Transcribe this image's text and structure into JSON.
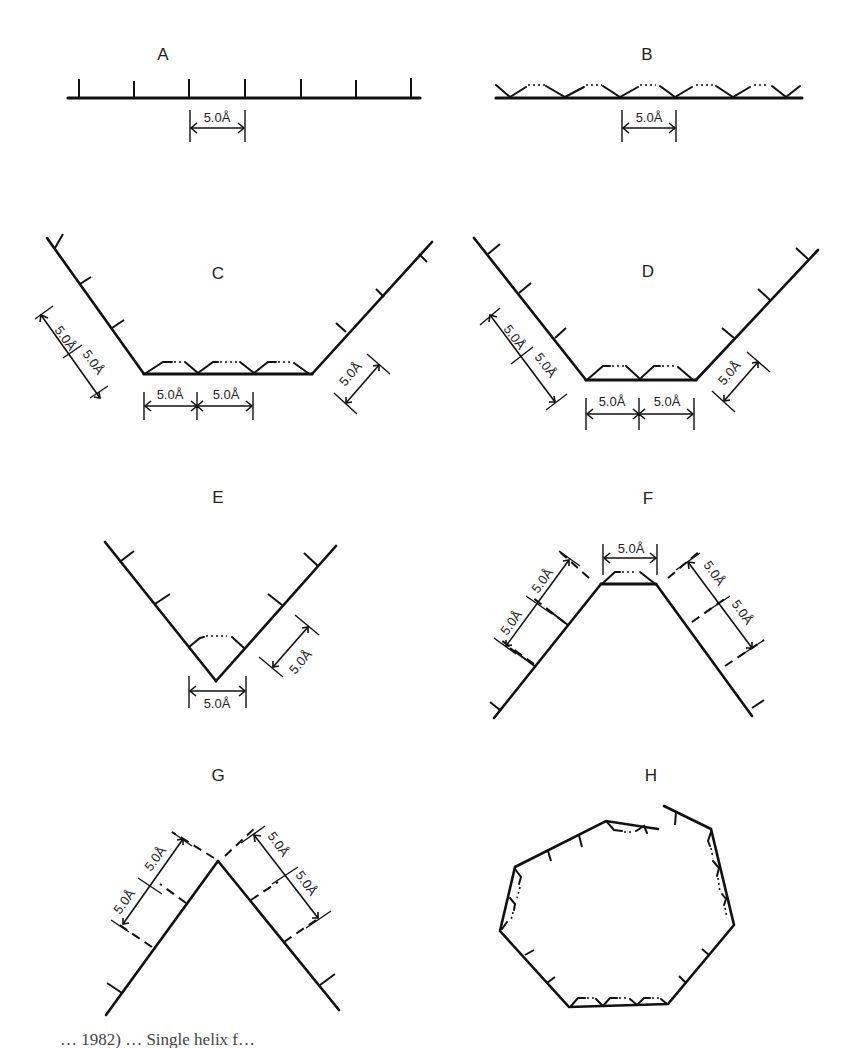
{
  "figure": {
    "panels": [
      {
        "id": "A",
        "label": "A",
        "dimensions": [
          "5.0Å"
        ]
      },
      {
        "id": "B",
        "label": "B",
        "dimensions": [
          "5.0Å"
        ]
      },
      {
        "id": "C",
        "label": "C",
        "dimensions": [
          "5.0Å",
          "5.0Å",
          "5.0Å",
          "5.0Å",
          "5.0Å"
        ]
      },
      {
        "id": "D",
        "label": "D",
        "dimensions": [
          "5.0Å",
          "5.0Å",
          "5.0Å",
          "5.0Å",
          "5.0Å"
        ]
      },
      {
        "id": "E",
        "label": "E",
        "dimensions": [
          "5.0Å",
          "5.0Å"
        ]
      },
      {
        "id": "F",
        "label": "F",
        "dimensions": [
          "5.0Å",
          "5.0Å",
          "5.0Å",
          "5.0Å",
          "5.0Å"
        ]
      },
      {
        "id": "G",
        "label": "G",
        "dimensions": [
          "5.0Å",
          "5.0Å",
          "5.0Å",
          "5.0Å"
        ]
      },
      {
        "id": "H",
        "label": "H",
        "dimensions": []
      }
    ],
    "spacing_label": "5.0Å",
    "caption_partial": "… 1982) … Single helix f…"
  }
}
